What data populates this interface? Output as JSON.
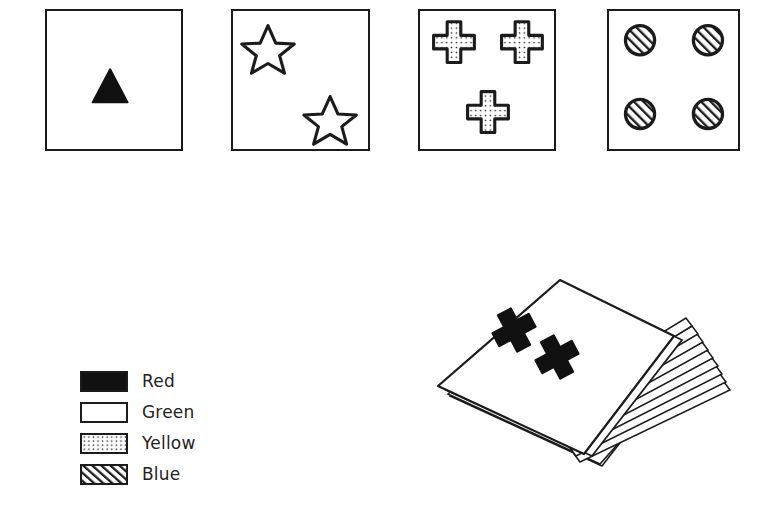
{
  "figure": {
    "background_color": "#ffffff",
    "ink_color": "#1b1b1b"
  },
  "cards": [
    {
      "id": "card-1",
      "symbol": "triangle",
      "symbol_count": 1,
      "color_name": "Red",
      "fill_pattern": "solid-black",
      "positions": [
        "center"
      ]
    },
    {
      "id": "card-2",
      "symbol": "star",
      "symbol_count": 2,
      "color_name": "Green",
      "fill_pattern": "blank-white",
      "positions": [
        "top-left",
        "bottom-right"
      ]
    },
    {
      "id": "card-3",
      "symbol": "cross",
      "symbol_count": 3,
      "color_name": "Yellow",
      "fill_pattern": "dotted",
      "positions": [
        "top-left",
        "top-right",
        "bottom-center"
      ]
    },
    {
      "id": "card-4",
      "symbol": "circle",
      "symbol_count": 4,
      "color_name": "Blue",
      "fill_pattern": "diagonal-hatch",
      "positions": [
        "top-left",
        "top-right",
        "bottom-left",
        "bottom-right"
      ]
    }
  ],
  "legend": {
    "entries": [
      {
        "label": "Red",
        "pattern": "solid-black",
        "swatch_fill": "#111111"
      },
      {
        "label": "Green",
        "pattern": "blank-white",
        "swatch_fill": "#ffffff"
      },
      {
        "label": "Yellow",
        "pattern": "dotted",
        "swatch_fill": "#ffffff"
      },
      {
        "label": "Blue",
        "pattern": "diagonal-hatch",
        "swatch_fill": "#ffffff"
      }
    ]
  },
  "deck": {
    "id": "card-deck",
    "description": "Fanned stack of cards",
    "visible_layers": 9,
    "top_card": {
      "symbol": "cross",
      "symbol_count": 2,
      "color_name": "Red",
      "fill_pattern": "solid-black"
    }
  }
}
